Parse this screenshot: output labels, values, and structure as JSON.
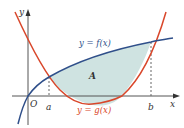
{
  "figure": {
    "axes": {
      "x_label": "x",
      "y_label": "y",
      "origin_label": "O"
    },
    "points": {
      "a_label": "a",
      "b_label": "b"
    },
    "curves": {
      "f": {
        "label": "y = f(x)",
        "color": "#2f4f8a"
      },
      "g": {
        "label": "y = g(x)",
        "color": "#d9472b"
      }
    },
    "region": {
      "label": "A",
      "fill": "#cfe3e1"
    },
    "colors": {
      "axis": "#555555",
      "dashed": "#666666",
      "text": "#333333"
    }
  }
}
